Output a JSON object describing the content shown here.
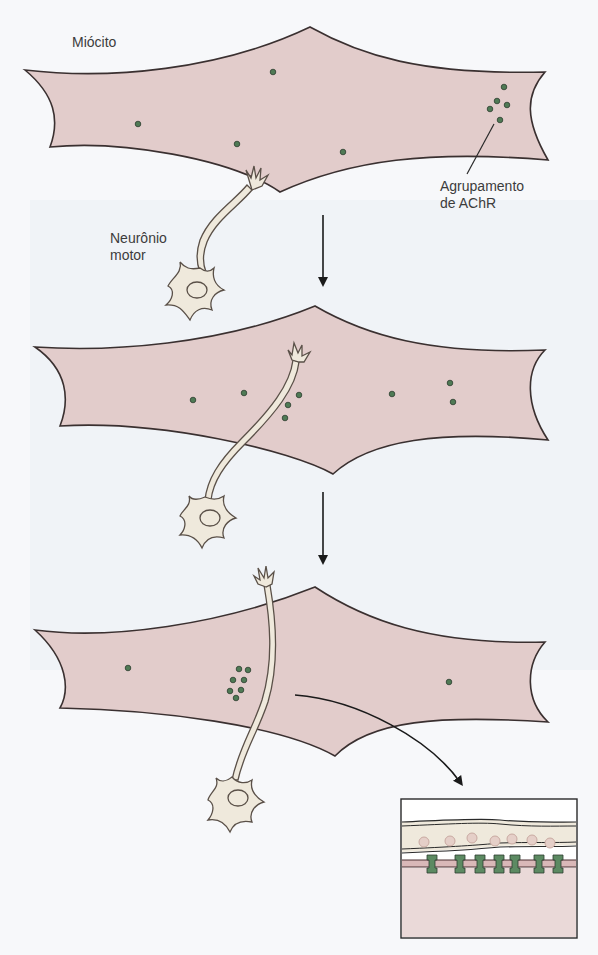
{
  "labels": {
    "myocyte": "Miócito",
    "achr_cluster_line1": "Agrupamento",
    "achr_cluster_line2": "de AChR",
    "motor_neuron_line1": "Neurônio",
    "motor_neuron_line2": "motor"
  },
  "colors": {
    "myocyte_fill": "#e2cccb",
    "myocyte_stroke": "#3a3030",
    "neuron_fill": "#efe9dc",
    "neuron_stroke": "#5a5048",
    "achr_dot": "#4f7a55",
    "achr_dot_stroke": "#2d3d30",
    "arrow": "#1a1a1a",
    "background": "#f7f8fa"
  },
  "stages": [
    {
      "name": "stage-1",
      "description": "Miócito com receptores AChR dispersos e agrupamento; neurônio motor se aproximando"
    },
    {
      "name": "stage-2",
      "description": "Neurônio motor contacta o miócito; AChR começam a agrupar"
    },
    {
      "name": "stage-3",
      "description": "AChR agrupados sob o terminal nervoso"
    }
  ],
  "inset": {
    "description": "Detalhe da junção: terminal nervoso com vesículas sobre membrana muscular com receptores AChR",
    "vesicle_count": 7,
    "receptor_count": 7
  }
}
